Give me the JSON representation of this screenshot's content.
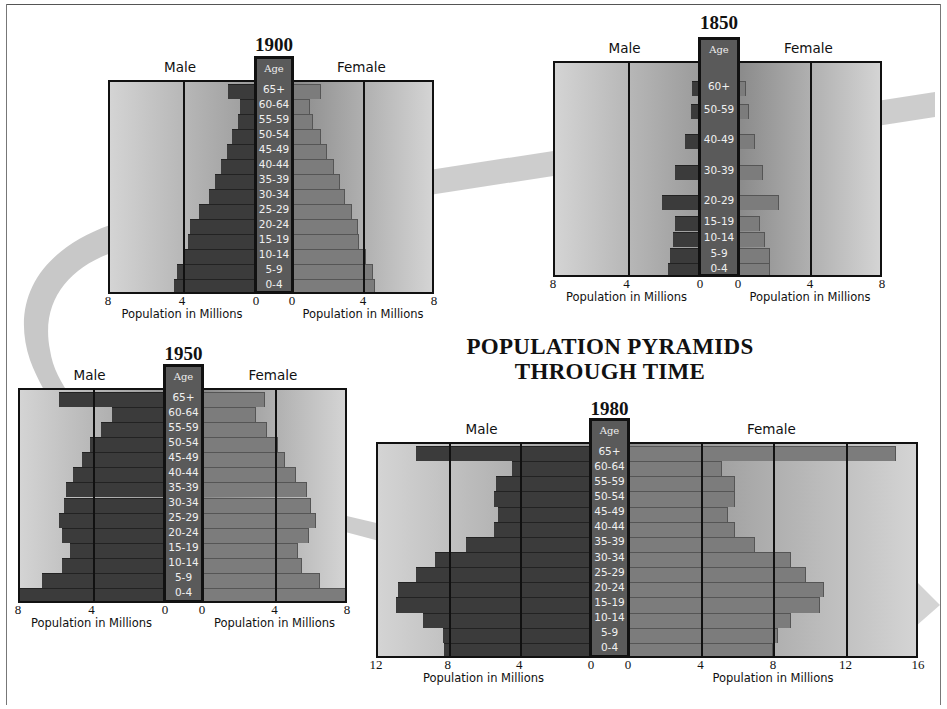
{
  "title": {
    "line1": "POPULATION PYRAMIDS",
    "line2": "THROUGH TIME"
  },
  "labels": {
    "male": "Male",
    "female": "Female",
    "age": "Age",
    "axis_title": "Population in Millions"
  },
  "colors": {
    "male_bar": "#3b3b3b",
    "female_bar": "#7c7c7c",
    "age_column": "#5a5a5a",
    "arrow": "#c8c8c8"
  },
  "chart_data": [
    {
      "type": "bar",
      "subtype": "population-pyramid",
      "title": "1900",
      "xlabel": "Population in Millions",
      "ylabel": "Age",
      "categories": [
        "65+",
        "60-64",
        "55-59",
        "50-54",
        "45-49",
        "40-44",
        "35-39",
        "30-34",
        "25-29",
        "20-24",
        "15-19",
        "10-14",
        "5-9",
        "0-4"
      ],
      "series": [
        {
          "name": "Male",
          "values": [
            1.6,
            0.95,
            1.1,
            1.4,
            1.7,
            2.0,
            2.35,
            2.65,
            3.2,
            3.7,
            3.8,
            4.0,
            4.4,
            4.55
          ]
        },
        {
          "name": "Female",
          "values": [
            1.65,
            1.0,
            1.2,
            1.65,
            1.95,
            2.35,
            2.7,
            3.0,
            3.4,
            3.7,
            3.8,
            4.15,
            4.55,
            4.7
          ]
        }
      ],
      "male_ticks": [
        "8",
        "4",
        "0"
      ],
      "female_ticks": [
        "0",
        "4",
        "8"
      ],
      "male_xlim": [
        0,
        8
      ],
      "female_xlim": [
        0,
        8
      ],
      "grid": true
    },
    {
      "type": "bar",
      "subtype": "population-pyramid",
      "title": "1850",
      "xlabel": "Population in Millions",
      "ylabel": "Age",
      "categories": [
        "60+",
        "50-59",
        "40-49",
        "30-39",
        "20-29",
        "15-19",
        "10-14",
        "5-9",
        "0-4"
      ],
      "series": [
        {
          "name": "Male",
          "values": [
            0.55,
            0.6,
            0.95,
            1.45,
            2.2,
            1.45,
            1.6,
            1.75,
            1.85
          ]
        },
        {
          "name": "Female",
          "values": [
            0.45,
            0.6,
            0.95,
            1.4,
            2.25,
            1.2,
            1.5,
            1.75,
            1.8
          ]
        }
      ],
      "male_ticks": [
        "8",
        "4",
        "0"
      ],
      "female_ticks": [
        "0",
        "4",
        "8"
      ],
      "male_xlim": [
        0,
        8
      ],
      "female_xlim": [
        0,
        8
      ],
      "grid": true
    },
    {
      "type": "bar",
      "subtype": "population-pyramid",
      "title": "1950",
      "xlabel": "Population in Millions",
      "ylabel": "Age",
      "categories": [
        "65+",
        "60-64",
        "55-59",
        "50-54",
        "45-49",
        "40-44",
        "35-39",
        "30-34",
        "25-29",
        "20-24",
        "15-19",
        "10-14",
        "5-9",
        "0-4"
      ],
      "series": [
        {
          "name": "Male",
          "values": [
            5.9,
            3.0,
            3.6,
            4.2,
            4.6,
            5.1,
            5.5,
            5.6,
            5.9,
            5.7,
            5.3,
            5.7,
            6.8,
            8.0
          ]
        },
        {
          "name": "Female",
          "values": [
            3.5,
            3.0,
            3.6,
            4.2,
            4.6,
            5.2,
            5.8,
            6.0,
            6.3,
            5.9,
            5.3,
            5.5,
            6.5,
            8.0
          ]
        }
      ],
      "male_ticks": [
        "8",
        "4",
        "0"
      ],
      "female_ticks": [
        "0",
        "4",
        "8"
      ],
      "male_xlim": [
        0,
        8
      ],
      "female_xlim": [
        0,
        8
      ],
      "grid": true
    },
    {
      "type": "bar",
      "subtype": "population-pyramid",
      "title": "1980",
      "xlabel": "Population in Millions",
      "ylabel": "Age",
      "categories": [
        "65+",
        "60-64",
        "55-59",
        "50-54",
        "45-49",
        "40-44",
        "35-39",
        "30-34",
        "25-29",
        "20-24",
        "15-19",
        "10-14",
        "5-9",
        "0-4"
      ],
      "series": [
        {
          "name": "Male",
          "values": [
            9.9,
            4.5,
            5.4,
            5.5,
            5.3,
            5.5,
            7.1,
            8.8,
            9.9,
            10.9,
            11.0,
            9.5,
            8.4,
            8.3
          ]
        },
        {
          "name": "Female",
          "values": [
            14.8,
            5.2,
            5.9,
            5.9,
            5.5,
            5.9,
            7.0,
            9.0,
            9.8,
            10.8,
            10.6,
            9.0,
            8.3,
            8.0
          ]
        }
      ],
      "male_ticks": [
        "12",
        "8",
        "4",
        "0"
      ],
      "female_ticks": [
        "0",
        "4",
        "8",
        "12",
        "16"
      ],
      "male_xlim": [
        0,
        12
      ],
      "female_xlim": [
        0,
        16
      ],
      "grid": true
    }
  ]
}
